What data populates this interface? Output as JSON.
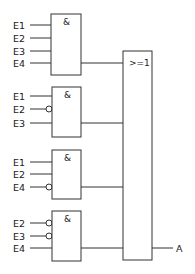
{
  "diagram": {
    "type": "logic-circuit",
    "and_gates": [
      {
        "symbol": "&",
        "box": [
          51,
          14,
          81,
          75
        ],
        "output_y": 63,
        "inputs": [
          {
            "label": "E1",
            "y": 25,
            "inverted": false
          },
          {
            "label": "E2",
            "y": 38,
            "inverted": false
          },
          {
            "label": "E3",
            "y": 51,
            "inverted": false
          },
          {
            "label": "E4",
            "y": 63,
            "inverted": false
          }
        ]
      },
      {
        "symbol": "&",
        "box": [
          52,
          87,
          81,
          137
        ],
        "output_y": 123,
        "inputs": [
          {
            "label": "E1",
            "y": 96,
            "inverted": false
          },
          {
            "label": "E2",
            "y": 109,
            "inverted": true
          },
          {
            "label": "E3",
            "y": 123,
            "inverted": false
          }
        ]
      },
      {
        "symbol": "&",
        "box": [
          52,
          150,
          81,
          199
        ],
        "output_y": 187,
        "inputs": [
          {
            "label": "E1",
            "y": 162,
            "inverted": false
          },
          {
            "label": "E2",
            "y": 174,
            "inverted": false
          },
          {
            "label": "E4",
            "y": 187,
            "inverted": true
          }
        ]
      },
      {
        "symbol": "&",
        "box": [
          52,
          211,
          81,
          261
        ],
        "output_y": 248,
        "inputs": [
          {
            "label": "E2",
            "y": 223,
            "inverted": true
          },
          {
            "label": "E3",
            "y": 236,
            "inverted": true
          },
          {
            "label": "E4",
            "y": 248,
            "inverted": false
          }
        ]
      }
    ],
    "or_gate": {
      "symbol": ">=1",
      "box": [
        123,
        51,
        152,
        260
      ]
    },
    "output": {
      "label": "A",
      "y": 248
    }
  }
}
